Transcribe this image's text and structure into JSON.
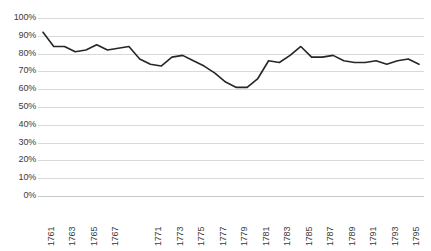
{
  "chart_data": {
    "type": "line",
    "title": "",
    "xlabel": "",
    "ylabel": "",
    "grid": true,
    "legend": false,
    "legend_position": "none",
    "line_color": "#262626",
    "gridline_color": "#d9d9d9",
    "background_color": "#ffffff",
    "xlim": [
      1761,
      1796
    ],
    "ylim": [
      0,
      100
    ],
    "y_tick_labels": [
      "100%",
      "90%",
      "80%",
      "70%",
      "60%",
      "50%",
      "40%",
      "30%",
      "20%",
      "10%",
      "0%"
    ],
    "y_tick_values": [
      100,
      90,
      80,
      70,
      60,
      50,
      40,
      30,
      20,
      10,
      0
    ],
    "x_tick_labels": [
      "1761",
      "1763",
      "1765",
      "1767",
      "1771",
      "1773",
      "1775",
      "1777",
      "1779",
      "1781",
      "1783",
      "1785",
      "1787",
      "1789",
      "1791",
      "1793",
      "1795"
    ],
    "x_tick_values": [
      1761,
      1763,
      1765,
      1767,
      1771,
      1773,
      1775,
      1777,
      1779,
      1781,
      1783,
      1785,
      1787,
      1789,
      1791,
      1793,
      1795
    ],
    "x": [
      1761,
      1762,
      1763,
      1764,
      1765,
      1766,
      1767,
      1768,
      1769,
      1770,
      1771,
      1772,
      1773,
      1774,
      1775,
      1776,
      1777,
      1778,
      1779,
      1780,
      1781,
      1782,
      1783,
      1784,
      1785,
      1786,
      1787,
      1788,
      1789,
      1790,
      1791,
      1792,
      1793,
      1794,
      1795,
      1796
    ],
    "values": [
      92,
      84,
      84,
      81,
      82,
      85,
      82,
      83,
      84,
      77,
      74,
      73,
      78,
      79,
      76,
      73,
      69,
      64,
      61,
      61,
      66,
      76,
      75,
      79,
      84,
      78,
      78,
      79,
      76,
      75,
      75,
      76,
      74,
      76,
      77,
      74
    ],
    "series": [
      {
        "name": "series-1",
        "values": [
          92,
          84,
          84,
          81,
          82,
          85,
          82,
          83,
          84,
          77,
          74,
          73,
          78,
          79,
          76,
          73,
          69,
          64,
          61,
          61,
          66,
          76,
          75,
          79,
          84,
          78,
          78,
          79,
          76,
          75,
          75,
          76,
          74,
          76,
          77,
          74
        ]
      }
    ]
  }
}
